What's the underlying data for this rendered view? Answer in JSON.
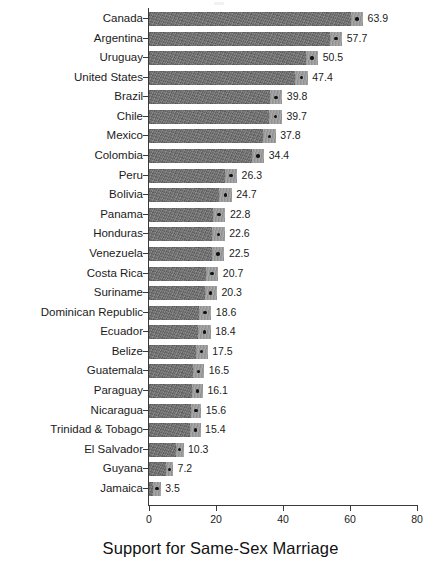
{
  "chart_data": {
    "type": "bar",
    "orientation": "horizontal",
    "title": "",
    "xlabel": "Support for Same-Sex Marriage",
    "ylabel": "",
    "xlim": [
      0,
      80
    ],
    "xticks": [
      0,
      20,
      40,
      60,
      80
    ],
    "grid": false,
    "legend": null,
    "sorted": "descending",
    "marker": "point-estimate-dot",
    "categories": [
      "Canada",
      "Argentina",
      "Uruguay",
      "United States",
      "Brazil",
      "Chile",
      "Mexico",
      "Colombia",
      "Peru",
      "Bolivia",
      "Panama",
      "Honduras",
      "Venezuela",
      "Costa Rica",
      "Suriname",
      "Dominican Republic",
      "Ecuador",
      "Belize",
      "Guatemala",
      "Paraguay",
      "Nicaragua",
      "Trinidad & Tobago",
      "El Salvador",
      "Guyana",
      "Jamaica"
    ],
    "values": [
      63.9,
      57.7,
      50.5,
      47.4,
      39.8,
      39.7,
      37.8,
      34.4,
      26.3,
      24.7,
      22.8,
      22.6,
      22.5,
      20.7,
      20.3,
      18.6,
      18.4,
      17.5,
      16.5,
      16.1,
      15.6,
      15.4,
      10.3,
      7.2,
      3.5
    ],
    "value_labels": [
      "63.9",
      "57.7",
      "50.5",
      "47.4",
      "39.8",
      "39.7",
      "37.8",
      "34.4",
      "26.3",
      "24.7",
      "22.8",
      "22.6",
      "22.5",
      "20.7",
      "20.3",
      "18.6",
      "18.4",
      "17.5",
      "16.5",
      "16.1",
      "15.6",
      "15.4",
      "10.3",
      "7.2",
      "3.5"
    ],
    "tick_labels": [
      "0",
      "20",
      "40",
      "60",
      "80"
    ],
    "colors": {
      "bar_fill": "#6e6e6e",
      "ci_fill": "#9a9a9a",
      "dot": "#111111",
      "axis": "#3a3a3a",
      "text": "#1b1b1b",
      "background": "#ffffff"
    }
  }
}
